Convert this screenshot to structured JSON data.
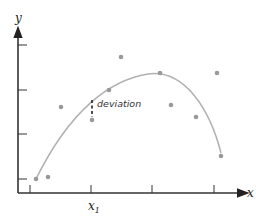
{
  "diagram": {
    "title": "",
    "axes": {
      "x_label": "x",
      "y_label": "y",
      "x_tick_label": "x",
      "x_tick_subscript": "1",
      "origin": [
        18,
        193
      ],
      "x_end": 245,
      "y_end": 30,
      "y_ticks_px": [
        45,
        90,
        134,
        179
      ],
      "x_ticks_px": [
        30,
        91,
        152,
        214
      ]
    },
    "curve": {
      "description": "fitted curve (concave down)",
      "path": "M36,179 C70,110 110,80 148,74 C185,69 210,110 221,153",
      "color": "#b0b0b0"
    },
    "points": [
      [
        36,
        179
      ],
      [
        48,
        177
      ],
      [
        61,
        107
      ],
      [
        92,
        120
      ],
      [
        109,
        90
      ],
      [
        121,
        57
      ],
      [
        160,
        73
      ],
      [
        171,
        105
      ],
      [
        196,
        117
      ],
      [
        217,
        73
      ],
      [
        221,
        156
      ]
    ],
    "point_color": "#999999",
    "deviation": {
      "label": "deviation",
      "x": 92,
      "y_from": 100,
      "y_to": 117,
      "label_x": 97,
      "label_y": 107
    }
  },
  "chart_data": {
    "type": "scatter",
    "title": "",
    "xlabel": "x",
    "ylabel": "y",
    "annotations": [
      "deviation",
      "x1"
    ],
    "grid": false,
    "series": [
      {
        "name": "data points",
        "points": [
          [
            36,
            179
          ],
          [
            48,
            177
          ],
          [
            61,
            107
          ],
          [
            92,
            120
          ],
          [
            109,
            90
          ],
          [
            121,
            57
          ],
          [
            160,
            73
          ],
          [
            171,
            105
          ],
          [
            196,
            117
          ],
          [
            217,
            73
          ],
          [
            221,
            156
          ]
        ]
      },
      {
        "name": "fitted curve",
        "type": "line"
      }
    ]
  }
}
